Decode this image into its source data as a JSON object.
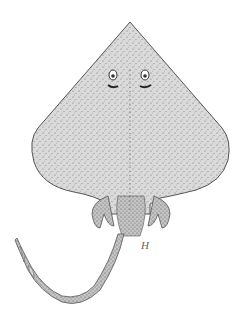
{
  "image": {
    "subject": "skate illustration",
    "background": "#ffffff",
    "body_fill": "#d9d9d9",
    "outline": "#555555",
    "stipple": "#6a6a6a",
    "signature": "H"
  }
}
